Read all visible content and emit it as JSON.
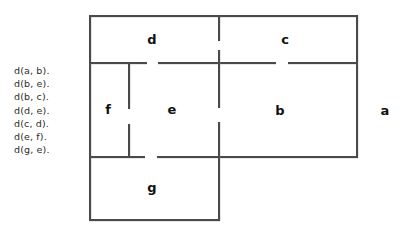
{
  "facts": {
    "title": "door-facts",
    "lines": [
      "d(a, b).",
      "d(b, e).",
      "d(b, c).",
      "d(d, e).",
      "d(c, d).",
      "d(e, f).",
      "d(g, e)."
    ]
  },
  "floorplan": {
    "colors": {
      "wall": "#4a4a4a",
      "label": "#111111",
      "background": "#ffffff"
    },
    "rooms": [
      {
        "id": "d",
        "label": "d",
        "x": 152,
        "y": 39
      },
      {
        "id": "c",
        "label": "c",
        "x": 285,
        "y": 39
      },
      {
        "id": "f",
        "label": "f",
        "x": 108,
        "y": 109
      },
      {
        "id": "e",
        "label": "e",
        "x": 172,
        "y": 109
      },
      {
        "id": "b",
        "label": "b",
        "x": 280,
        "y": 110
      },
      {
        "id": "g",
        "label": "g",
        "x": 152,
        "y": 187
      },
      {
        "id": "a",
        "label": "a",
        "x": 385,
        "y": 110
      }
    ],
    "doors": [
      {
        "between": [
          "c",
          "d"
        ],
        "orientation": "vertical"
      },
      {
        "between": [
          "d",
          "e"
        ],
        "orientation": "horizontal"
      },
      {
        "between": [
          "b",
          "c"
        ],
        "orientation": "horizontal"
      },
      {
        "between": [
          "e",
          "f"
        ],
        "orientation": "vertical"
      },
      {
        "between": [
          "b",
          "e"
        ],
        "orientation": "vertical"
      },
      {
        "between": [
          "g",
          "e"
        ],
        "orientation": "horizontal"
      },
      {
        "between": [
          "a",
          "b"
        ],
        "orientation": "vertical"
      }
    ]
  }
}
